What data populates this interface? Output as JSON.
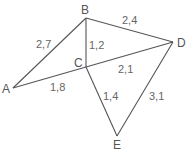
{
  "diagram": {
    "type": "weighted-graph",
    "colors": {
      "edge": "#555555",
      "label": "#666666",
      "background": "#ffffff"
    },
    "vertices": [
      {
        "id": "A",
        "label": "A"
      },
      {
        "id": "B",
        "label": "B"
      },
      {
        "id": "C",
        "label": "C"
      },
      {
        "id": "D",
        "label": "D"
      },
      {
        "id": "E",
        "label": "E"
      }
    ],
    "edges": [
      {
        "from": "A",
        "to": "B",
        "weight": "2,7"
      },
      {
        "from": "B",
        "to": "D",
        "weight": "2,4"
      },
      {
        "from": "B",
        "to": "C",
        "weight": "1,2"
      },
      {
        "from": "A",
        "to": "C",
        "weight": "1,8"
      },
      {
        "from": "C",
        "to": "D",
        "weight": "2,1"
      },
      {
        "from": "C",
        "to": "E",
        "weight": "1,4"
      },
      {
        "from": "D",
        "to": "E",
        "weight": "3,1"
      }
    ]
  }
}
